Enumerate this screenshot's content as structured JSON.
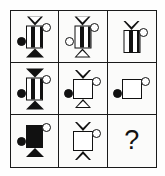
{
  "puzzle": {
    "kind": "ravens-progressive-matrix",
    "rows": 3,
    "columns": 3,
    "ink_color": "#111111",
    "paper_color": "#fbfbfa",
    "border_color": "#1a1a1a",
    "missing_cell_label": "?",
    "cells": [
      {
        "id": "r1c1",
        "position": "row1-col1",
        "top_cap": "triangle-down-outline",
        "body": "bar-striped",
        "bottom_cap": "triangle-up-solid",
        "left_circle": "filled",
        "right_circle": "outline",
        "description": "Striped vertical bar with outline funnel on top, solid black triangle base, filled dot at left, open circle at upper right"
      },
      {
        "id": "r1c2",
        "position": "row1-col2",
        "top_cap": "triangle-down-outline",
        "body": "bar-striped",
        "bottom_cap": "triangle-up-outline",
        "left_circle": "outline",
        "right_circle": "outline",
        "description": "Striped vertical bar with outline funnel on top, outline triangle base, open circle at left, open circle at upper right"
      },
      {
        "id": "r1c3",
        "position": "row1-col3",
        "top_cap": "triangle-down-outline",
        "body": "bar-striped",
        "bottom_cap": "none",
        "left_circle": "none",
        "right_circle": "outline",
        "description": "Striped vertical bar with outline funnel on top, no base, open circle at upper right"
      },
      {
        "id": "r2c1",
        "position": "row2-col1",
        "top_cap": "triangle-down-solid",
        "body": "bar-striped",
        "bottom_cap": "triangle-up-solid",
        "left_circle": "filled",
        "right_circle": "outline",
        "description": "Striped vertical bar with solid black triangle on top and bottom, filled dot at left, open circle at upper right"
      },
      {
        "id": "r2c2",
        "position": "row2-col2",
        "top_cap": "triangle-down-outline",
        "body": "square-open",
        "bottom_cap": "triangle-up-outline",
        "left_circle": "filled",
        "right_circle": "outline",
        "description": "Open square body with outline funnel on top, outline triangle base, filled dot at left, open circle at upper right"
      },
      {
        "id": "r2c3",
        "position": "row2-col3",
        "top_cap": "none",
        "body": "square-open",
        "bottom_cap": "none",
        "left_circle": "filled",
        "right_circle": "outline",
        "description": "Open square body alone, filled dot at left, open circle at upper right"
      },
      {
        "id": "r3c1",
        "position": "row3-col1",
        "top_cap": "none",
        "body": "bar-solid",
        "bottom_cap": "triangle-up-solid",
        "left_circle": "filled",
        "right_circle": "outline",
        "description": "Solid black vertical bar with solid black triangle base, filled dot at left, open circle at upper right"
      },
      {
        "id": "r3c2",
        "position": "row3-col2",
        "top_cap": "triangle-down-outline",
        "body": "square-open",
        "bottom_cap": "triangle-up-outline",
        "left_circle": "none",
        "right_circle": "outline",
        "description": "Open square body with outline funnel on top, outline triangle base, open circle at upper right"
      },
      {
        "id": "r3c3",
        "position": "row3-col3",
        "top_cap": "none",
        "body": "none",
        "bottom_cap": "none",
        "left_circle": "none",
        "right_circle": "none",
        "is_missing": true,
        "label": "?",
        "description": "Missing element, shown as a question mark"
      }
    ]
  }
}
